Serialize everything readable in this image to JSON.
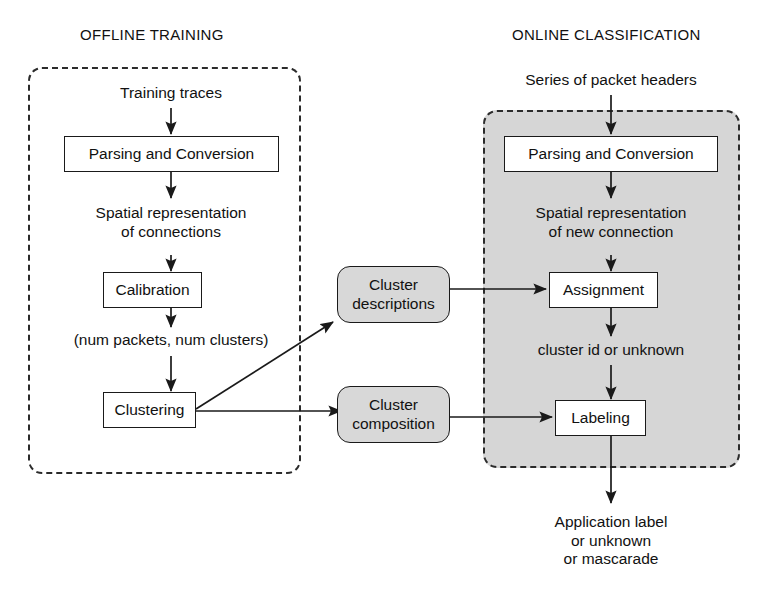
{
  "diagram": {
    "background_color": "#ffffff",
    "stroke_color": "#1a1a1a",
    "store_fill_color": "#d8d8d8",
    "shaded_region_color": "#d6d6d6"
  },
  "sections": [
    {
      "id": "offline",
      "label": "OFFLINE TRAINING",
      "shaded": false
    },
    {
      "id": "online",
      "label": "ONLINE CLASSIFICATION",
      "shaded": true
    }
  ],
  "offline": {
    "title": "OFFLINE TRAINING",
    "input_label": "Training traces",
    "parsing_box": "Parsing and Conversion",
    "intermediate_label": "Spatial representation\nof connections",
    "calibration_box": "Calibration",
    "calibration_output_label": "(num packets, num clusters)",
    "clustering_box": "Clustering"
  },
  "online": {
    "title": "ONLINE CLASSIFICATION",
    "input_label": "Series of packet headers",
    "parsing_box": "Parsing and Conversion",
    "intermediate_label": "Spatial representation\nof new connection",
    "assignment_box": "Assignment",
    "assignment_output_label": "cluster id or unknown",
    "labeling_box": "Labeling",
    "output_label": "Application label\nor unknown\nor mascarade"
  },
  "stores": [
    {
      "id": "cluster-descriptions",
      "line1": "Cluster",
      "line2": "descriptions"
    },
    {
      "id": "cluster-composition",
      "line1": "Cluster",
      "line2": "composition"
    }
  ],
  "edges": [
    {
      "from": "training-traces",
      "to": "offline-parsing",
      "kind": "arrow-down"
    },
    {
      "from": "offline-parsing",
      "to": "spatial-connections",
      "kind": "arrow-down"
    },
    {
      "from": "spatial-connections",
      "to": "calibration",
      "kind": "arrow-down"
    },
    {
      "from": "calibration",
      "to": "num-packets-num-clusters",
      "kind": "arrow-down"
    },
    {
      "from": "num-packets-num-clusters",
      "to": "clustering",
      "kind": "arrow-down"
    },
    {
      "from": "clustering",
      "to": "cluster-descriptions",
      "kind": "arrow-diagonal-up-right"
    },
    {
      "from": "clustering",
      "to": "cluster-composition",
      "kind": "arrow-right"
    },
    {
      "from": "cluster-descriptions",
      "to": "assignment",
      "kind": "arrow-right"
    },
    {
      "from": "cluster-composition",
      "to": "labeling",
      "kind": "arrow-right"
    },
    {
      "from": "packet-headers",
      "to": "online-parsing",
      "kind": "arrow-down"
    },
    {
      "from": "online-parsing",
      "to": "spatial-new-connection",
      "kind": "arrow-down"
    },
    {
      "from": "spatial-new-connection",
      "to": "assignment",
      "kind": "arrow-down"
    },
    {
      "from": "assignment",
      "to": "cluster-id-or-unknown",
      "kind": "arrow-down"
    },
    {
      "from": "cluster-id-or-unknown",
      "to": "labeling",
      "kind": "arrow-down"
    },
    {
      "from": "labeling",
      "to": "application-label",
      "kind": "arrow-down"
    }
  ]
}
